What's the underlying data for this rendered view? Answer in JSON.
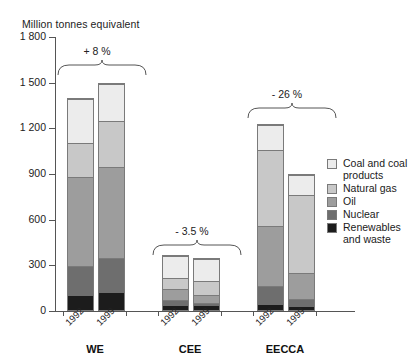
{
  "chart_data": {
    "type": "bar",
    "title": "Million tonnes equivalent",
    "subtitle": "",
    "xlabel": "",
    "ylabel": "Million tonnes equivalent",
    "ylim": [
      0,
      1800
    ],
    "yticks": [
      0,
      300,
      600,
      900,
      1200,
      1500,
      1800
    ],
    "ytick_labels": [
      "0",
      "300",
      "600",
      "900",
      "1 200",
      "1 500",
      "1 800"
    ],
    "grid": false,
    "stacked": true,
    "legend_position": "right",
    "groups": [
      "WE",
      "CEE",
      "EECCA"
    ],
    "categories": [
      "1992",
      "1999",
      "1992",
      "1999",
      "1992",
      "1999"
    ],
    "series": [
      {
        "name": "Renewables and waste",
        "color": "#1c1c1c",
        "values": [
          90,
          110,
          25,
          25,
          30,
          20
        ]
      },
      {
        "name": "Nuclear",
        "color": "#6e6e6e",
        "values": [
          200,
          235,
          45,
          25,
          130,
          55
        ]
      },
      {
        "name": "Oil",
        "color": "#9d9d9d",
        "values": [
          590,
          600,
          70,
          55,
          400,
          170
        ]
      },
      {
        "name": "Natural gas",
        "color": "#c8c8c8",
        "values": [
          230,
          305,
          75,
          95,
          500,
          520
        ]
      },
      {
        "name": "Coal and coal products",
        "color": "#ececec",
        "values": [
          290,
          250,
          150,
          150,
          170,
          135
        ]
      }
    ],
    "totals": [
      1400,
      1500,
      365,
      350,
      1230,
      900
    ],
    "annotations": [
      {
        "group": "WE",
        "text": "+ 8 %"
      },
      {
        "group": "CEE",
        "text": "- 3.5 %"
      },
      {
        "group": "EECCA",
        "text": "- 26 %"
      }
    ]
  },
  "legend": {
    "entries": [
      {
        "label": "Coal and coal products",
        "color": "#ececec"
      },
      {
        "label": "Natural gas",
        "color": "#c8c8c8"
      },
      {
        "label": "Oil",
        "color": "#9d9d9d"
      },
      {
        "label": "Nuclear",
        "color": "#6e6e6e"
      },
      {
        "label": "Renewables and waste",
        "color": "#1c1c1c"
      }
    ]
  },
  "axis": {
    "title": "Million tonnes equivalent",
    "tick_1800": "1 800",
    "tick_1500": "1 500",
    "tick_1200": "1 200",
    "tick_900": "900",
    "tick_600": "600",
    "tick_300": "300",
    "tick_0": "0"
  },
  "groups": {
    "we": "WE",
    "cee": "CEE",
    "eecca": "EECCA"
  },
  "xlabels": {
    "we_1992": "1992",
    "we_1999": "1999",
    "cee_1992": "1992",
    "cee_1999": "1999",
    "eecca_1992": "1992",
    "eecca_1999": "1999"
  },
  "pct": {
    "we": "+ 8 %",
    "cee": "- 3.5 %",
    "eecca": "- 26 %"
  }
}
